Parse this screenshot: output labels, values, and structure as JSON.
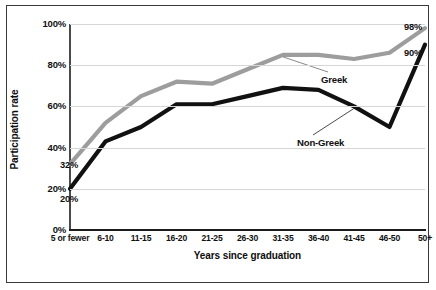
{
  "chart_data": {
    "type": "line",
    "title": "",
    "xlabel": "Years since graduation",
    "ylabel": "Participation rate",
    "categories": [
      "5 or fewer",
      "6-10",
      "11-15",
      "16-20",
      "21-25",
      "26-30",
      "31-35",
      "36-40",
      "41-45",
      "46-50",
      "50+"
    ],
    "ylim": [
      0,
      100
    ],
    "yticks": [
      "0%",
      "20%",
      "40%",
      "60%",
      "80%",
      "100%"
    ],
    "ytick_values": [
      0,
      20,
      40,
      60,
      80,
      100
    ],
    "grid": true,
    "legend": "inline-annotations",
    "series": [
      {
        "name": "Greek",
        "color": "#9d9d9d",
        "values": [
          32,
          52,
          65,
          72,
          71,
          78,
          85,
          85,
          83,
          86,
          98
        ]
      },
      {
        "name": "Non-Greek",
        "color": "#111111",
        "values": [
          20,
          43,
          50,
          61,
          61,
          65,
          69,
          68,
          60,
          50,
          90
        ]
      }
    ],
    "point_labels": [
      {
        "text": "32%",
        "series": "Greek",
        "category": "5 or fewer"
      },
      {
        "text": "20%",
        "series": "Non-Greek",
        "category": "5 or fewer"
      },
      {
        "text": "98%",
        "series": "Greek",
        "category": "50+"
      },
      {
        "text": "90%",
        "series": "Non-Greek",
        "category": "50+"
      }
    ],
    "annotations": [
      {
        "text": "Greek",
        "series": "Greek"
      },
      {
        "text": "Non-Greek",
        "series": "Non-Greek"
      }
    ]
  },
  "colors": {
    "greek_line": "#9d9d9d",
    "nongreek_line": "#111111",
    "gridline": "#d6d6d6",
    "axis": "#1c1c1c",
    "frame": "#3a3a3a",
    "background": "#ffffff"
  }
}
